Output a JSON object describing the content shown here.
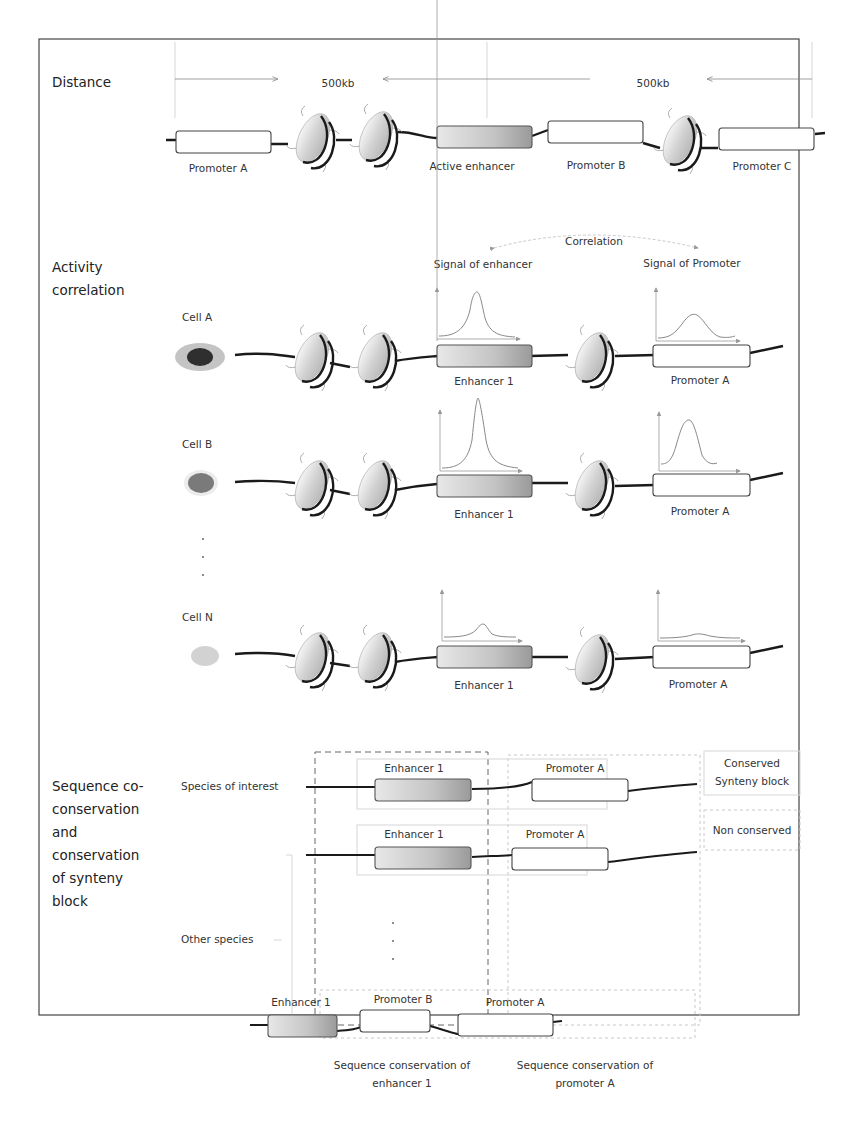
{
  "figure": {
    "sections": {
      "distance": {
        "title": "Distance"
      },
      "activity": {
        "title_line1": "Activity",
        "title_line2": "correlation"
      },
      "sequence": {
        "title_lines": [
          "Sequence co-",
          "conservation",
          "and",
          "conservation",
          "of synteny",
          "block"
        ]
      }
    },
    "distance_panel": {
      "distance_left": "500kb",
      "distance_right": "500kb",
      "elements": {
        "promoter_a": "Promoter A",
        "active_enhancer": "Active enhancer",
        "promoter_b": "Promoter B",
        "promoter_c": "Promoter C"
      }
    },
    "activity_panel": {
      "correlation_label": "Correlation",
      "signal_enhancer_label": "Signal of enhancer",
      "signal_promoter_label": "Signal of Promoter",
      "cells": [
        {
          "name": "Cell A",
          "enhancer_label": "Enhancer 1",
          "promoter_label": "Promoter A",
          "cell_color": "#2f2f2f",
          "halo_color": "#b9b9b9"
        },
        {
          "name": "Cell B",
          "enhancer_label": "Enhancer 1",
          "promoter_label": "Promoter A",
          "cell_color": "#7a7a7a",
          "halo_color": "#e6e6e6"
        },
        {
          "name": "Cell N",
          "enhancer_label": "Enhancer 1",
          "promoter_label": "Promoter A",
          "cell_color": "#cfcfcf",
          "halo_color": "#f2f2f2"
        }
      ],
      "ellipsis": "..."
    },
    "sequence_panel": {
      "species_of_interest": "Species of interest",
      "other_species": "Other species",
      "rows": [
        {
          "enhancer_label": "Enhancer 1",
          "promoter_label": "Promoter A"
        },
        {
          "enhancer_label": "Enhancer 1",
          "promoter_label": "Promoter A"
        },
        {
          "enhancer_label": "Enhancer 1",
          "promoter_b_label": "Promoter B",
          "promoter_label": "Promoter A"
        }
      ],
      "legend": {
        "conserved_line1": "Conserved",
        "conserved_line2": "Synteny block",
        "non_conserved": "Non conserved"
      },
      "footer": {
        "enhancer_line1": "Sequence conservation of",
        "enhancer_line2": "enhancer 1",
        "promoter_line1": "Sequence conservation of",
        "promoter_line2": "promoter A"
      }
    }
  }
}
